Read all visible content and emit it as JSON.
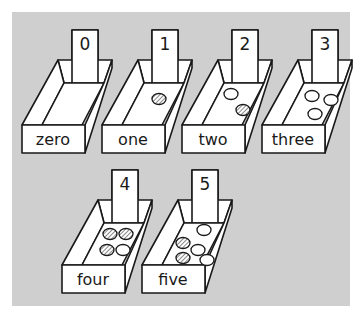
{
  "illustration": {
    "description": "Counting boxes 0 to 5 with number cards and counters",
    "background_color": "#cfcfcf",
    "boxes": [
      {
        "number": "0",
        "word": "zero",
        "counters": []
      },
      {
        "number": "1",
        "word": "one",
        "counters": [
          "hatched"
        ]
      },
      {
        "number": "2",
        "word": "two",
        "counters": [
          "empty",
          "hatched"
        ]
      },
      {
        "number": "3",
        "word": "three",
        "counters": [
          "empty",
          "empty",
          "empty"
        ]
      },
      {
        "number": "4",
        "word": "four",
        "counters": [
          "hatched",
          "hatched",
          "hatched",
          "empty"
        ]
      },
      {
        "number": "5",
        "word": "five",
        "counters": [
          "hatched",
          "hatched",
          "empty",
          "empty",
          "empty"
        ]
      }
    ]
  }
}
